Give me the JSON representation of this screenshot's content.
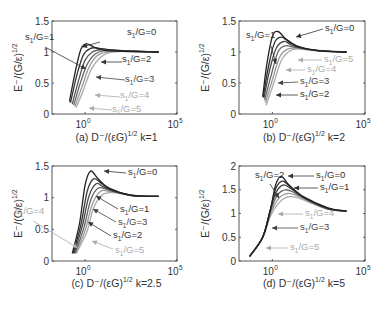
{
  "figure": {
    "panels": [
      {
        "id": "a",
        "caption": "(a) D⁻/(εG)",
        "caption_exp": "1/2",
        "caption_k": "k=1",
        "ylabel": "E⁻/(G/ε)",
        "ylabel_exp": "1/2",
        "yticks": [
          "0",
          "0.5",
          "1",
          "1.5"
        ],
        "xticks": [
          "10",
          "10"
        ],
        "xtick_exps": [
          "0",
          "5"
        ]
      },
      {
        "id": "b",
        "caption": "(b) D⁻/(εG)",
        "caption_exp": "1/2",
        "caption_k": "k=2",
        "ylabel": "E⁻/(G/ε)",
        "ylabel_exp": "1/2",
        "yticks": [
          "0",
          "0.5",
          "1",
          "1.5"
        ],
        "xticks": [
          "10",
          "10"
        ],
        "xtick_exps": [
          "0",
          "5"
        ]
      },
      {
        "id": "c",
        "caption": "(c) D⁻/(εG)",
        "caption_exp": "1/2",
        "caption_k": "k=2.5",
        "ylabel": "E⁻/(G/ε)",
        "ylabel_exp": "1/2",
        "yticks": [
          "0",
          "0.5",
          "1",
          "1.5"
        ],
        "xticks": [
          "10",
          "10"
        ],
        "xtick_exps": [
          "0",
          "5"
        ]
      },
      {
        "id": "d",
        "caption": "(d) D⁻/(εG)",
        "caption_exp": "1/2",
        "caption_k": "k=5",
        "ylabel": "E⁻/(G/ε)",
        "ylabel_exp": "1/2",
        "yticks": [
          "0",
          "0.5",
          "1",
          "1.5",
          "2"
        ],
        "xticks": [
          "10",
          "10"
        ],
        "xtick_exps": [
          "0",
          "5"
        ]
      }
    ],
    "annotation_prefix": "s",
    "annotation_sub": "1",
    "annotation_suffix": "/G="
  },
  "chart_data": [
    {
      "type": "line",
      "title": "(a) D⁻/(εG)^1/2 k=1",
      "xlabel": "D⁻/(εG)^1/2",
      "ylabel": "E⁻/(G/ε)^1/2",
      "xscale": "log",
      "xlim": [
        0.0158,
        100000
      ],
      "ylim": [
        0,
        1.5
      ],
      "xticks": [
        "10^0",
        "10^5"
      ],
      "yticks": [
        0,
        0.5,
        1,
        1.5
      ],
      "grid": false,
      "legend": "inline annotations with arrows",
      "series": [
        {
          "name": "s1/G=0",
          "color": "#222222",
          "x": [
            0.14,
            0.3,
            0.6,
            1.2,
            3,
            10,
            100,
            10000
          ],
          "y": [
            0.2,
            0.7,
            1.05,
            1.13,
            1.08,
            1.03,
            1.01,
            1.0
          ]
        },
        {
          "name": "s1/G=1",
          "color": "#333333",
          "x": [
            0.16,
            0.35,
            0.8,
            2,
            6,
            30,
            1000,
            10000
          ],
          "y": [
            0.18,
            0.62,
            0.95,
            1.06,
            1.06,
            1.03,
            1.01,
            1.0
          ]
        },
        {
          "name": "s1/G=2",
          "color": "#555555",
          "x": [
            0.2,
            0.45,
            1.0,
            2.5,
            8,
            50,
            1000,
            10000
          ],
          "y": [
            0.16,
            0.55,
            0.87,
            1.0,
            1.04,
            1.03,
            1.01,
            1.0
          ]
        },
        {
          "name": "s1/G=3",
          "color": "#666666",
          "x": [
            0.24,
            0.55,
            1.3,
            3.5,
            10,
            80,
            1000,
            10000
          ],
          "y": [
            0.14,
            0.5,
            0.8,
            0.97,
            1.02,
            1.02,
            1.01,
            1.0
          ]
        },
        {
          "name": "s1/G=4",
          "color": "#999999",
          "x": [
            0.28,
            0.7,
            1.6,
            4.5,
            15,
            100,
            1000,
            10000
          ],
          "y": [
            0.12,
            0.45,
            0.75,
            0.94,
            1.0,
            1.01,
            1.0,
            1.0
          ]
        },
        {
          "name": "s1/G=5",
          "color": "#aaaaaa",
          "x": [
            0.32,
            0.8,
            2,
            6,
            20,
            150,
            1000,
            10000
          ],
          "y": [
            0.1,
            0.38,
            0.7,
            0.9,
            0.99,
            1.01,
            1.0,
            1.0
          ]
        }
      ]
    },
    {
      "type": "line",
      "title": "(b) D⁻/(εG)^1/2 k=2",
      "xlabel": "D⁻/(εG)^1/2",
      "ylabel": "E⁻/(G/ε)^1/2",
      "xscale": "log",
      "xlim": [
        0.0158,
        100000
      ],
      "ylim": [
        0,
        1.5
      ],
      "xticks": [
        "10^0",
        "10^5"
      ],
      "yticks": [
        0,
        0.5,
        1,
        1.5
      ],
      "grid": false,
      "legend": "inline annotations with arrows",
      "series": [
        {
          "name": "s1/G=0",
          "color": "#222222",
          "x": [
            0.3,
            0.5,
            1.0,
            2.0,
            5,
            20,
            200,
            10000
          ],
          "y": [
            0.28,
            0.8,
            1.25,
            1.33,
            1.22,
            1.1,
            1.03,
            1.0
          ]
        },
        {
          "name": "s1/G=1",
          "color": "#333333",
          "x": [
            0.32,
            0.6,
            1.3,
            3,
            8,
            30,
            300,
            10000
          ],
          "y": [
            0.27,
            0.75,
            1.15,
            1.24,
            1.16,
            1.08,
            1.02,
            1.0
          ]
        },
        {
          "name": "s1/G=2",
          "color": "#444444",
          "x": [
            0.35,
            0.7,
            1.6,
            4,
            10,
            40,
            400,
            10000
          ],
          "y": [
            0.26,
            0.7,
            1.06,
            1.17,
            1.12,
            1.06,
            1.02,
            1.0
          ]
        },
        {
          "name": "s1/G=3",
          "color": "#666666",
          "x": [
            0.38,
            0.85,
            2,
            5,
            15,
            60,
            500,
            10000
          ],
          "y": [
            0.22,
            0.62,
            1.0,
            1.1,
            1.08,
            1.05,
            1.02,
            1.0
          ]
        },
        {
          "name": "s1/G=4",
          "color": "#999999",
          "x": [
            0.42,
            1.0,
            2.5,
            7,
            20,
            80,
            600,
            10000
          ],
          "y": [
            0.18,
            0.55,
            0.92,
            1.05,
            1.06,
            1.04,
            1.01,
            1.0
          ]
        },
        {
          "name": "s1/G=5",
          "color": "#aaaaaa",
          "x": [
            0.46,
            1.2,
            3,
            9,
            30,
            100,
            800,
            10000
          ],
          "y": [
            0.14,
            0.5,
            0.86,
            1.02,
            1.05,
            1.03,
            1.01,
            1.0
          ]
        }
      ]
    },
    {
      "type": "line",
      "title": "(c) D⁻/(εG)^1/2 k=2.5",
      "xlabel": "D⁻/(εG)^1/2",
      "ylabel": "E⁻/(G/ε)^1/2",
      "xscale": "log",
      "xlim": [
        0.0158,
        100000
      ],
      "ylim": [
        0,
        1.5
      ],
      "xticks": [
        "10^0",
        "10^5"
      ],
      "yticks": [
        0,
        0.5,
        1,
        1.5
      ],
      "grid": false,
      "legend": "inline annotations with arrows",
      "series": [
        {
          "name": "s1/G=0",
          "color": "#222222",
          "x": [
            0.2,
            0.5,
            1.0,
            2.0,
            5,
            20,
            300,
            10000
          ],
          "y": [
            0.12,
            0.6,
            1.2,
            1.42,
            1.3,
            1.15,
            1.04,
            1.02
          ]
        },
        {
          "name": "s1/G=1",
          "color": "#333333",
          "x": [
            0.22,
            0.6,
            1.3,
            3,
            8,
            30,
            400,
            10000
          ],
          "y": [
            0.12,
            0.58,
            1.1,
            1.3,
            1.22,
            1.12,
            1.03,
            1.02
          ]
        },
        {
          "name": "s1/G=2",
          "color": "#444444",
          "x": [
            0.25,
            0.7,
            1.6,
            4,
            10,
            40,
            500,
            10000
          ],
          "y": [
            0.12,
            0.55,
            1.02,
            1.22,
            1.17,
            1.1,
            1.03,
            1.02
          ]
        },
        {
          "name": "s1/G=3",
          "color": "#666666",
          "x": [
            0.28,
            0.85,
            2,
            5,
            15,
            60,
            600,
            10000
          ],
          "y": [
            0.12,
            0.52,
            0.96,
            1.15,
            1.13,
            1.08,
            1.03,
            1.02
          ]
        },
        {
          "name": "s1/G=4",
          "color": "#999999",
          "x": [
            0.3,
            1.0,
            2.5,
            7,
            20,
            80,
            700,
            10000
          ],
          "y": [
            0.12,
            0.48,
            0.9,
            1.1,
            1.1,
            1.07,
            1.03,
            1.02
          ]
        },
        {
          "name": "s1/G=5",
          "color": "#aaaaaa",
          "x": [
            0.33,
            1.2,
            3,
            9,
            30,
            100,
            800,
            10000
          ],
          "y": [
            0.12,
            0.45,
            0.85,
            1.05,
            1.08,
            1.06,
            1.03,
            1.02
          ]
        }
      ]
    },
    {
      "type": "line",
      "title": "(d) D⁻/(εG)^1/2 k=5",
      "xlabel": "D⁻/(εG)^1/2",
      "ylabel": "E⁻/(G/ε)^1/2",
      "xscale": "log",
      "xlim": [
        0.0158,
        100000
      ],
      "ylim": [
        0,
        2
      ],
      "xticks": [
        "10^0",
        "10^5"
      ],
      "yticks": [
        0,
        0.5,
        1,
        1.5,
        2
      ],
      "grid": false,
      "legend": "inline annotations with arrows",
      "series": [
        {
          "name": "s1/G=0",
          "color": "#222222",
          "x": [
            0.06,
            0.3,
            0.8,
            1.5,
            3,
            8,
            50,
            1000,
            10000
          ],
          "y": [
            0.1,
            0.5,
            1.1,
            1.6,
            1.78,
            1.6,
            1.35,
            1.12,
            1.05
          ]
        },
        {
          "name": "s1/G=1",
          "color": "#333333",
          "x": [
            0.06,
            0.3,
            0.8,
            1.5,
            3.5,
            10,
            60,
            1000,
            10000
          ],
          "y": [
            0.1,
            0.5,
            1.1,
            1.52,
            1.68,
            1.55,
            1.32,
            1.11,
            1.05
          ]
        },
        {
          "name": "s1/G=2",
          "color": "#444444",
          "x": [
            0.06,
            0.3,
            0.8,
            1.6,
            4,
            12,
            70,
            1000,
            10000
          ],
          "y": [
            0.1,
            0.5,
            1.1,
            1.45,
            1.6,
            1.5,
            1.3,
            1.1,
            1.05
          ]
        },
        {
          "name": "s1/G=3",
          "color": "#666666",
          "x": [
            0.06,
            0.3,
            0.8,
            1.8,
            5,
            15,
            80,
            1000,
            10000
          ],
          "y": [
            0.1,
            0.5,
            1.05,
            1.38,
            1.5,
            1.44,
            1.28,
            1.1,
            1.05
          ]
        },
        {
          "name": "s1/G=4",
          "color": "#999999",
          "x": [
            0.06,
            0.3,
            0.8,
            2,
            6,
            20,
            100,
            1000,
            10000
          ],
          "y": [
            0.1,
            0.5,
            1.0,
            1.3,
            1.42,
            1.38,
            1.25,
            1.1,
            1.05
          ]
        },
        {
          "name": "s1/G=5",
          "color": "#aaaaaa",
          "x": [
            0.06,
            0.3,
            0.8,
            2.2,
            7,
            25,
            120,
            1000,
            10000
          ],
          "y": [
            0.1,
            0.5,
            0.95,
            1.22,
            1.35,
            1.33,
            1.22,
            1.09,
            1.05
          ]
        }
      ]
    }
  ],
  "annotations": [
    [
      {
        "value": "0",
        "tx": 127,
        "ty": 35,
        "color": "#333333",
        "ax": 100,
        "ay": 42,
        "hx": 82,
        "hy": 47
      },
      {
        "value": "1",
        "tx": 25,
        "ty": 40,
        "color": "#333333",
        "ax": 45,
        "ay": 47,
        "hx": 86,
        "hy": 69
      },
      {
        "value": "2",
        "tx": 122,
        "ty": 62,
        "color": "#333333",
        "ax": 122,
        "ay": 62,
        "hx": 101,
        "hy": 62
      },
      {
        "value": "3",
        "tx": 125,
        "ty": 82,
        "color": "#444444",
        "ax": 125,
        "ay": 80,
        "hx": 96,
        "hy": 77
      },
      {
        "value": "4",
        "tx": 120,
        "ty": 98,
        "color": "#aaaaaa",
        "ax": 120,
        "ay": 97,
        "hx": 95,
        "hy": 95
      },
      {
        "value": "5",
        "tx": 112,
        "ty": 112,
        "color": "#aaaaaa",
        "ax": 112,
        "ay": 110,
        "hx": 89,
        "hy": 108
      }
    ],
    [
      {
        "value": "0",
        "tx": 325,
        "ty": 31,
        "color": "#333333",
        "ax": 323,
        "ay": 29,
        "hx": 296,
        "hy": 37
      },
      {
        "value": "1",
        "tx": 246,
        "ty": 38,
        "color": "#333333",
        "ax": 271,
        "ay": 46,
        "hx": 276,
        "hy": 64
      },
      {
        "value": "2",
        "tx": 300,
        "ty": 97,
        "color": "#333333",
        "ax": 298,
        "ay": 95,
        "hx": 276,
        "hy": 95
      },
      {
        "value": "3",
        "tx": 300,
        "ty": 84,
        "color": "#444444",
        "ax": 298,
        "ay": 82,
        "hx": 278,
        "hy": 83
      },
      {
        "value": "4",
        "tx": 307,
        "ty": 72,
        "color": "#aaaaaa",
        "ax": 305,
        "ay": 70,
        "hx": 286,
        "hy": 70
      },
      {
        "value": "5",
        "tx": 324,
        "ty": 62,
        "color": "#aaaaaa",
        "ax": 322,
        "ay": 60,
        "hx": 298,
        "hy": 60
      }
    ],
    [
      {
        "value": "0",
        "tx": 128,
        "ty": 175,
        "color": "#333333",
        "ax": 126,
        "ay": 173,
        "hx": 104,
        "hy": 171
      },
      {
        "value": "1",
        "tx": 120,
        "ty": 212,
        "color": "#333333",
        "ax": 118,
        "ay": 209,
        "hx": 96,
        "hy": 196
      },
      {
        "value": "2",
        "tx": 113,
        "ty": 238,
        "color": "#333333",
        "ax": 111,
        "ay": 236,
        "hx": 88,
        "hy": 222
      },
      {
        "value": "3",
        "tx": 118,
        "ty": 225,
        "color": "#444444",
        "ax": 116,
        "ay": 222,
        "hx": 93,
        "hy": 209
      },
      {
        "value": "4",
        "tx": 15,
        "ty": 214,
        "color": "#aaaaaa",
        "ax": 33,
        "ay": 221,
        "hx": 78,
        "hy": 248
      },
      {
        "value": "5",
        "tx": 115,
        "ty": 253,
        "color": "#aaaaaa",
        "ax": 113,
        "ay": 249,
        "hx": 92,
        "hy": 241
      }
    ],
    [
      {
        "value": "0",
        "tx": 316,
        "ty": 178,
        "color": "#333333",
        "ax": 314,
        "ay": 176,
        "hx": 288,
        "hy": 176
      },
      {
        "value": "1",
        "tx": 320,
        "ty": 190,
        "color": "#333333",
        "ax": 318,
        "ay": 188,
        "hx": 294,
        "hy": 188
      },
      {
        "value": "2",
        "tx": 255,
        "ty": 178,
        "color": "#333333",
        "ax": 270,
        "ay": 184,
        "hx": 279,
        "hy": 198
      },
      {
        "value": "3",
        "tx": 300,
        "ty": 230,
        "color": "#444444",
        "ax": 298,
        "ay": 228,
        "hx": 272,
        "hy": 228
      },
      {
        "value": "4",
        "tx": 305,
        "ty": 216,
        "color": "#aaaaaa",
        "ax": 303,
        "ay": 214,
        "hx": 278,
        "hy": 214
      },
      {
        "value": "5",
        "tx": 290,
        "ty": 250,
        "color": "#aaaaaa",
        "ax": 288,
        "ay": 248,
        "hx": 266,
        "hy": 248
      }
    ]
  ]
}
